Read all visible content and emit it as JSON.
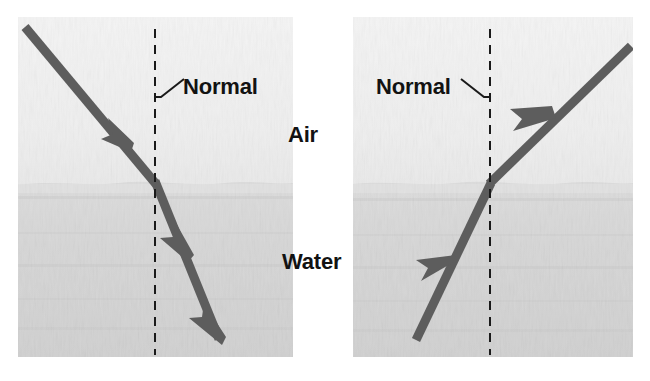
{
  "figure": {
    "type": "physics-diagram",
    "background_color": "#ffffff",
    "media": {
      "air": {
        "label": "Air",
        "color": "#efefef"
      },
      "water": {
        "label": "Water",
        "color": "#d5d5d5"
      }
    },
    "ray_color": "#5d5d5d",
    "normal_line_color": "#1a1a1a",
    "panels": [
      {
        "id": "left-panel",
        "name": "air-to-water",
        "description": "Light ray travelling from air into water bends toward the normal",
        "rect": {
          "x": 18,
          "y": 17,
          "width": 275,
          "height": 340
        },
        "interface_y": 183,
        "normal_x": 155,
        "normal_label": "Normal",
        "leader_from": {
          "x": 155,
          "y": 95
        },
        "leader_to": {
          "x": 181,
          "y": 80
        },
        "rays": [
          {
            "name": "incident-ray",
            "medium": "air",
            "from": {
              "x": 26,
              "y": 28
            },
            "to": {
              "x": 155,
              "y": 183
            },
            "arrowhead_at": {
              "x": 122,
              "y": 143
            },
            "direction": "down-right"
          },
          {
            "name": "refracted-ray",
            "medium": "water",
            "from": {
              "x": 155,
              "y": 183
            },
            "to": {
              "x": 218,
              "y": 338
            },
            "arrowheads_at": [
              {
                "x": 181,
                "y": 248
              },
              {
                "x": 215,
                "y": 332
              }
            ],
            "direction": "down-right"
          }
        ]
      },
      {
        "id": "right-panel",
        "name": "water-to-air",
        "description": "Light ray travelling from water into air bends away from the normal",
        "rect": {
          "x": 353,
          "y": 17,
          "width": 280,
          "height": 340
        },
        "interface_y": 183,
        "normal_x": 490,
        "normal_label": "Normal",
        "leader_from": {
          "x": 490,
          "y": 95
        },
        "leader_to": {
          "x": 464,
          "y": 80
        },
        "rays": [
          {
            "name": "incident-ray",
            "medium": "water",
            "from": {
              "x": 417,
              "y": 338
            },
            "to": {
              "x": 490,
              "y": 183
            },
            "arrowhead_at": {
              "x": 447,
              "y": 274
            },
            "direction": "up-right"
          },
          {
            "name": "emergent-ray",
            "medium": "air",
            "from": {
              "x": 490,
              "y": 183
            },
            "to": {
              "x": 629,
              "y": 48
            },
            "arrowhead_at": {
              "x": 549,
              "y": 126
            },
            "direction": "up-right"
          }
        ]
      }
    ]
  }
}
